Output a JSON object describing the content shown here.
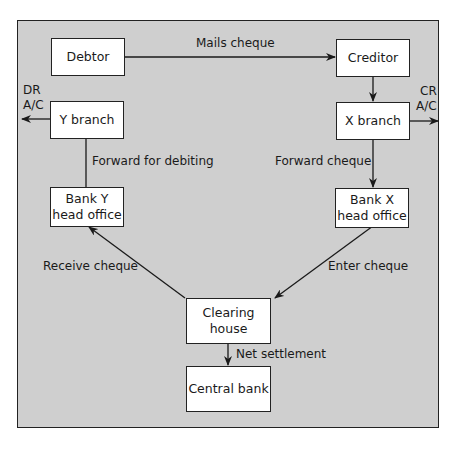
{
  "diagram": {
    "type": "flowchart",
    "title": "",
    "nodes": {
      "debtor": "Debtor",
      "creditor": "Creditor",
      "y_branch": "Y branch",
      "x_branch": "X branch",
      "bank_y_head_office": [
        "Bank Y",
        "head office"
      ],
      "bank_x_head_office": [
        "Bank X",
        "head office"
      ],
      "clearing_house": [
        "Clearing",
        "house"
      ],
      "central_bank": "Central bank"
    },
    "edges": {
      "mails_cheque": "Mails cheque",
      "forward_for_debiting": "Forward for debiting",
      "forward_cheque": "Forward cheque",
      "receive_cheque": "Receive cheque",
      "enter_cheque": "Enter cheque",
      "net_settlement": "Net settlement"
    },
    "side_labels": {
      "dr": [
        "DR",
        "A/C"
      ],
      "cr": [
        "CR",
        "A/C"
      ]
    }
  }
}
